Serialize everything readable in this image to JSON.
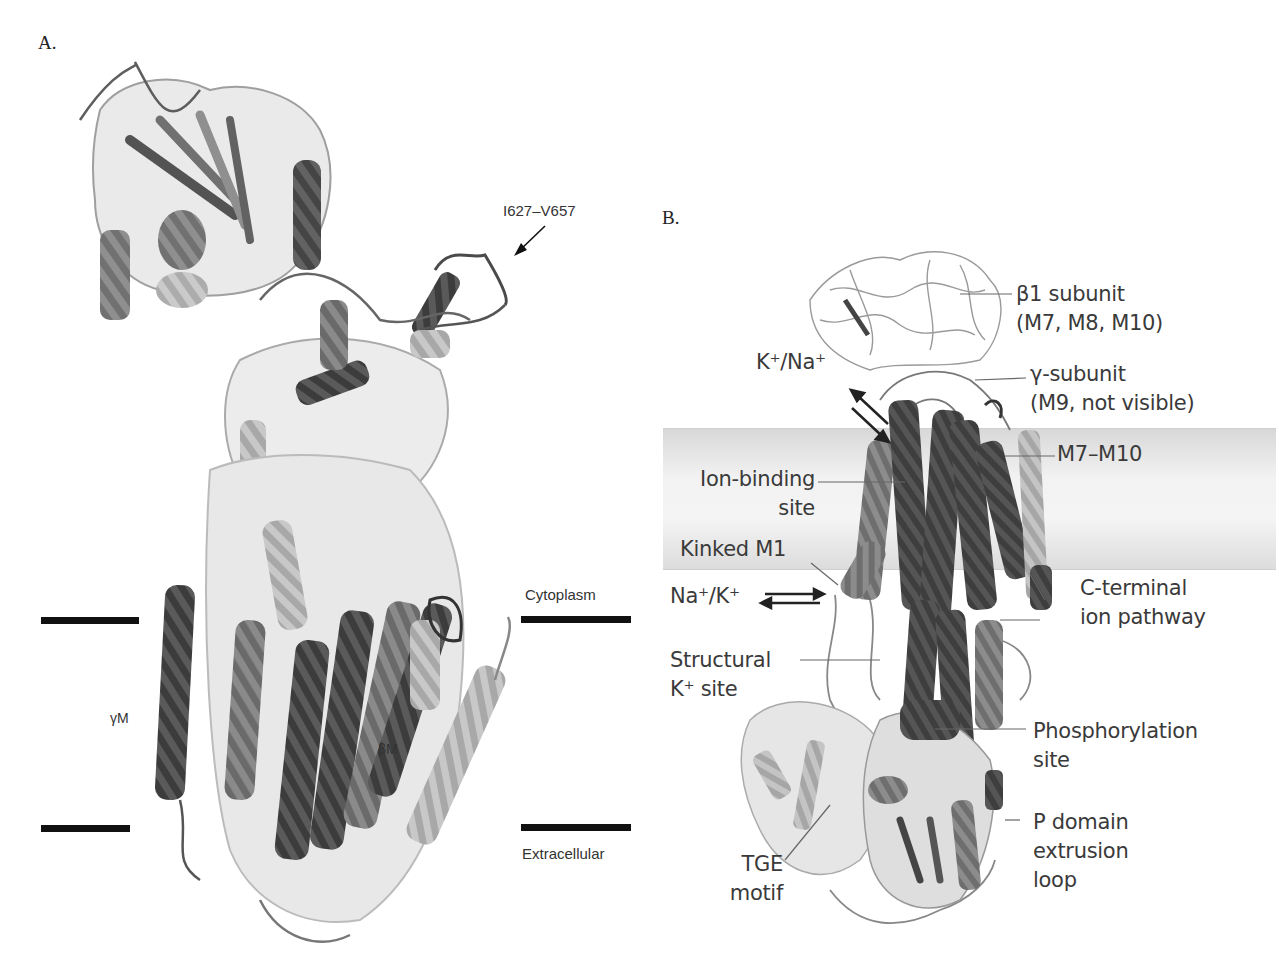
{
  "panel_a": {
    "label": "A.",
    "annotations": {
      "loop_residues": "I627–V657",
      "gamma_m": "γM",
      "beta_m": "βM",
      "cytoplasm": "Cytoplasm",
      "extracellular": "Extracellular"
    }
  },
  "panel_b": {
    "label": "B.",
    "annotations": {
      "beta1_subunit_line1": "β1 subunit",
      "beta1_subunit_line2": "(M7, M8, M10)",
      "gamma_subunit_line1": "γ-subunit",
      "gamma_subunit_line2": "(M9, not visible)",
      "m7_m10": "M7–M10",
      "k_na_flux": "K⁺/Na⁺",
      "ion_binding_line1": "Ion-binding",
      "ion_binding_line2": "site",
      "kinked_m1": "Kinked M1",
      "na_k_flux": "Na⁺/K⁺",
      "c_terminal_line1": "C-terminal",
      "c_terminal_line2": "ion pathway",
      "structural_line1": "Structural",
      "structural_line2": "K⁺ site",
      "phosphorylation_line1": "Phosphorylation",
      "phosphorylation_line2": "site",
      "p_domain_line1": "P domain",
      "p_domain_line2": "extrusion",
      "p_domain_line3": "loop",
      "tge_line1": "TGE",
      "tge_line2": "motif"
    }
  },
  "colors": {
    "membrane_band": "#e4e4e4",
    "bar": "#111111",
    "helix_dark": "#4a4a4a",
    "helix_mid": "#7a7a7a",
    "helix_light": "#b5b5b5"
  }
}
